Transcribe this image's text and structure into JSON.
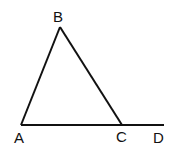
{
  "diagram": {
    "points": {
      "A": {
        "label": "A",
        "x": 21,
        "y": 125,
        "lx": 14,
        "ly": 143
      },
      "B": {
        "label": "B",
        "x": 60,
        "y": 27,
        "lx": 53,
        "ly": 22
      },
      "C": {
        "label": "C",
        "x": 122,
        "y": 125,
        "lx": 116,
        "ly": 142
      },
      "D": {
        "label": "D",
        "x": 164,
        "y": 125,
        "lx": 153,
        "ly": 143
      }
    },
    "segments": [
      [
        "A",
        "B"
      ],
      [
        "B",
        "C"
      ],
      [
        "A",
        "D"
      ]
    ],
    "stroke_color": "#111111"
  }
}
